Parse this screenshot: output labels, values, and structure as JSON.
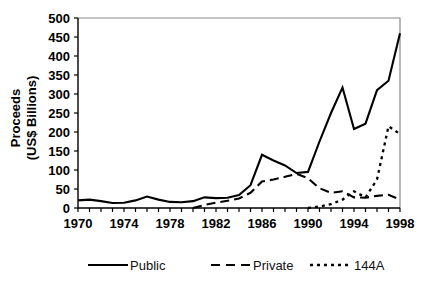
{
  "chart_data": {
    "type": "line",
    "title": "",
    "xlabel": "",
    "ylabel": "Proceeds\n(US$ Billions)",
    "ylabel_line1": "Proceeds",
    "ylabel_line2": "(US$ Billions)",
    "xlim": [
      1970,
      1998
    ],
    "ylim": [
      0,
      500
    ],
    "ytick_step": 50,
    "xtick_step": 1,
    "xtick_label_step": 4,
    "grid": false,
    "legend_position": "bottom",
    "x": [
      1970,
      1971,
      1972,
      1973,
      1974,
      1975,
      1976,
      1977,
      1978,
      1979,
      1980,
      1981,
      1982,
      1983,
      1984,
      1985,
      1986,
      1987,
      1988,
      1989,
      1990,
      1991,
      1992,
      1993,
      1994,
      1995,
      1996,
      1997,
      1998
    ],
    "xticks": [
      1970,
      1971,
      1972,
      1973,
      1974,
      1975,
      1976,
      1977,
      1978,
      1979,
      1980,
      1981,
      1982,
      1983,
      1984,
      1985,
      1986,
      1987,
      1988,
      1989,
      1990,
      1991,
      1992,
      1993,
      1994,
      1995,
      1996,
      1997,
      1998
    ],
    "xtick_labels": [
      "1970",
      "1974",
      "1978",
      "1982",
      "1986",
      "1990",
      "1994",
      "1998"
    ],
    "xtick_label_values": [
      1970,
      1974,
      1978,
      1982,
      1986,
      1990,
      1994,
      1998
    ],
    "yticks": [
      0,
      50,
      100,
      150,
      200,
      250,
      300,
      350,
      400,
      450,
      500
    ],
    "ytick_labels": [
      "0",
      "50",
      "100",
      "150",
      "200",
      "250",
      "300",
      "350",
      "400",
      "450",
      "500"
    ],
    "series": [
      {
        "name": "Public",
        "style": "solid",
        "color": "#000000",
        "x": [
          1970,
          1971,
          1972,
          1973,
          1974,
          1975,
          1976,
          1977,
          1978,
          1979,
          1980,
          1981,
          1982,
          1983,
          1984,
          1985,
          1986,
          1987,
          1988,
          1989,
          1990,
          1991,
          1992,
          1993,
          1994,
          1995,
          1996,
          1997,
          1998
        ],
        "values": [
          20,
          22,
          18,
          13,
          14,
          20,
          30,
          22,
          16,
          15,
          18,
          28,
          26,
          27,
          34,
          60,
          140,
          125,
          112,
          92,
          95,
          175,
          250,
          317,
          208,
          222,
          310,
          335,
          460
        ]
      },
      {
        "name": "Private",
        "style": "dashed",
        "color": "#000000",
        "x": [
          1980,
          1981,
          1982,
          1983,
          1984,
          1985,
          1986,
          1987,
          1988,
          1989,
          1990,
          1991,
          1992,
          1993,
          1994,
          1995,
          1996,
          1997,
          1998
        ],
        "values": [
          0,
          8,
          14,
          19,
          25,
          40,
          70,
          75,
          82,
          90,
          78,
          52,
          40,
          44,
          28,
          27,
          32,
          35,
          22
        ]
      },
      {
        "name": "144A",
        "style": "dotted",
        "color": "#000000",
        "x": [
          1990,
          1991,
          1992,
          1993,
          1994,
          1995,
          1996,
          1997,
          1998
        ],
        "values": [
          0,
          4,
          10,
          22,
          44,
          28,
          75,
          215,
          195
        ]
      }
    ],
    "legend": [
      {
        "label": "Public",
        "style": "solid"
      },
      {
        "label": "Private",
        "style": "dashed"
      },
      {
        "label": "144A",
        "style": "dotted"
      }
    ]
  }
}
